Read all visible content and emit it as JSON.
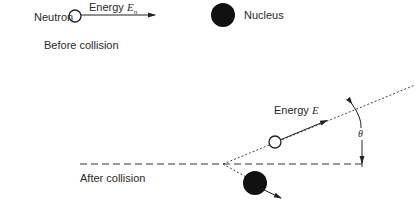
{
  "diagram": {
    "before": {
      "neutron_label": "Neutron",
      "energy_label": "Energy ",
      "energy_symbol": "E",
      "energy_subscript": "n",
      "nucleus_label": "Nucleus",
      "caption": "Before collision"
    },
    "after": {
      "energy_label": "Energy ",
      "energy_symbol": "E",
      "angle_symbol": "θ",
      "caption": "After collision"
    },
    "colors": {
      "stroke": "#222222",
      "nucleus_fill": "#111111",
      "neutron_fill": "#ffffff"
    }
  }
}
